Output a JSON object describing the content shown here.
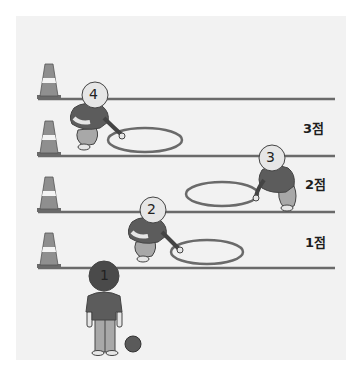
{
  "scene": {
    "description": "Hoop ring-toss game field with four lanes and score labels",
    "colors": {
      "background": "#ffffff",
      "panel": "#f2f2f2",
      "line": "#6a6a6a",
      "cone": "#8f8f8f",
      "cone_band": "#f4f4f4",
      "shirt": "#5c5c5c",
      "pants": "#a8a8a8",
      "head": "#e6e6e6",
      "hair": "#4a4a4a",
      "ball": "#5a5a5a"
    },
    "score_labels": [
      {
        "text": "3점",
        "x": 303,
        "y": 118
      },
      {
        "text": "2점",
        "x": 305,
        "y": 174
      },
      {
        "text": "1점",
        "x": 305,
        "y": 232
      }
    ],
    "players": [
      {
        "number": "1",
        "x": 104,
        "y": 276,
        "pose": "standing-back"
      },
      {
        "number": "2",
        "x": 153,
        "y": 210,
        "pose": "crouching"
      },
      {
        "number": "3",
        "x": 272,
        "y": 158,
        "pose": "crouching"
      },
      {
        "number": "4",
        "x": 95,
        "y": 95,
        "pose": "crouching"
      }
    ]
  }
}
